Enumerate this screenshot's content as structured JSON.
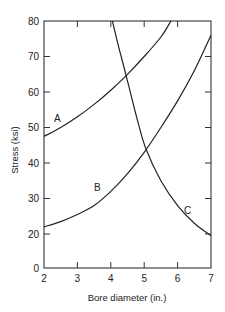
{
  "chart_data": {
    "type": "line",
    "title": "",
    "xlabel": "Bore diameter (in.)",
    "ylabel": "Stress (ksi)",
    "xlim": [
      2,
      7
    ],
    "ylim": [
      0,
      80
    ],
    "x_ticks": [
      2,
      3,
      4,
      5,
      6,
      7
    ],
    "y_ticks": [
      0,
      20,
      30,
      40,
      50,
      60,
      70,
      80
    ],
    "y_axis_break": "compressed between 0 and 20 (no 10 tick)",
    "grid": false,
    "legend": "inline curve labels",
    "series": [
      {
        "name": "A",
        "x": [
          2,
          2.5,
          3,
          3.5,
          4,
          4.5,
          5,
          5.5,
          5.8
        ],
        "y": [
          47.5,
          50,
          53,
          56.5,
          60.5,
          65,
          70,
          75.5,
          80
        ],
        "label_pos": [
          2.4,
          52.5
        ]
      },
      {
        "name": "B",
        "x": [
          2,
          2.5,
          3,
          3.5,
          4,
          4.5,
          5,
          5.5,
          6,
          6.5,
          7
        ],
        "y": [
          22,
          23.5,
          25.5,
          28,
          32,
          37,
          43,
          50,
          57.5,
          66,
          76
        ],
        "label_pos": [
          3.6,
          33
        ]
      },
      {
        "name": "C",
        "x": [
          4.05,
          4.2,
          4.45,
          4.8,
          5.05,
          5.5,
          6,
          6.5,
          7
        ],
        "y": [
          80,
          74,
          65,
          52,
          44,
          35,
          28,
          23,
          19
        ],
        "label_pos": [
          6.3,
          26.5
        ]
      }
    ]
  }
}
